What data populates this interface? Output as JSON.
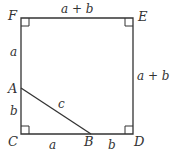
{
  "diagram": {
    "type": "geometry",
    "points": {
      "F": {
        "label": "F",
        "x": 21,
        "y": 18
      },
      "E": {
        "label": "E",
        "x": 133,
        "y": 18
      },
      "D": {
        "label": "D",
        "x": 133,
        "y": 134
      },
      "C": {
        "label": "C",
        "x": 21,
        "y": 134
      },
      "A": {
        "label": "A",
        "x": 21,
        "y": 88
      },
      "B": {
        "label": "B",
        "x": 91,
        "y": 134
      }
    },
    "segment_labels": {
      "FE": "a + b",
      "ED": "a + b",
      "FA": "a",
      "AC": "b",
      "CB": "a",
      "BD": "b",
      "AB": "c"
    },
    "right_angles": [
      "F",
      "E",
      "C",
      "D"
    ],
    "colors": {
      "stroke": "#333333",
      "background": "#ffffff"
    }
  }
}
